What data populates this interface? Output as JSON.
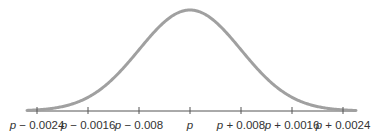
{
  "chart_data": {
    "type": "line",
    "title": "",
    "xlabel": "",
    "ylabel": "",
    "distribution": "normal",
    "mean_label": "p",
    "tick_labels": [
      "p − 0.0024",
      "p − 0.0016",
      "p − 0.008",
      "p",
      "p + 0.008",
      "p + 0.0016",
      "p + 0.0024"
    ],
    "tick_offsets": [
      -3,
      -2,
      -1,
      0,
      1,
      2,
      3
    ],
    "grid": false,
    "legend": null,
    "colors": {
      "curve": "#a0a0a0",
      "axis": "#555555",
      "text": "#333333"
    }
  },
  "ticks": [
    {
      "var": "p",
      "op": " − ",
      "num": "0.0024"
    },
    {
      "var": "p",
      "op": " − ",
      "num": "0.0016"
    },
    {
      "var": "p",
      "op": " − ",
      "num": "0.008"
    },
    {
      "var": "p",
      "op": "",
      "num": ""
    },
    {
      "var": "p",
      "op": " + ",
      "num": "0.008"
    },
    {
      "var": "p",
      "op": " + ",
      "num": "0.0016"
    },
    {
      "var": "p",
      "op": " + ",
      "num": "0.0024"
    }
  ]
}
